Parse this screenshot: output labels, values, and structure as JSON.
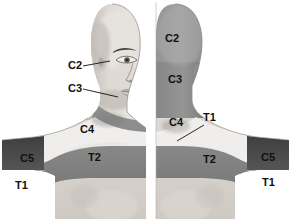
{
  "figure": {
    "type": "anatomical-dermatome-illustration",
    "panel_count": 2,
    "background_color": "#ffffff"
  },
  "palette": {
    "skin_light": "#e7e3df",
    "skin_mid": "#cfcac5",
    "skin_shadow": "#b4aea8",
    "c2_band": "#9a9a9a",
    "c3_band": "#8d8d8d",
    "c4_band": "#efeeec",
    "t2_band": "#7f7f7f",
    "c5_band": "#4a4a4a",
    "t1_band": "#9e9e9e",
    "outline": "#6b6b6b",
    "label_text": "#111111",
    "leader_line": "#111111"
  },
  "panels": [
    {
      "id": "anterior",
      "name": "anterior-view",
      "view_label": "anterior",
      "description": "Front view, right half of face and chest with dermatome bands",
      "labels": [
        {
          "text": "C2",
          "x": 68,
          "y": 69,
          "has_leader": true,
          "leader": "M 83 66 L 110 61"
        },
        {
          "text": "C3",
          "x": 68,
          "y": 92,
          "has_leader": true,
          "leader": "M 83 89 L 118 97"
        },
        {
          "text": "C4",
          "x": 80,
          "y": 133,
          "has_leader": false,
          "leader": ""
        },
        {
          "text": "T2",
          "x": 88,
          "y": 161,
          "has_leader": false,
          "leader": ""
        },
        {
          "text": "C5",
          "x": 20,
          "y": 162,
          "has_leader": false,
          "leader": ""
        },
        {
          "text": "T1",
          "x": 15,
          "y": 189,
          "has_leader": false,
          "leader": ""
        }
      ]
    },
    {
      "id": "posterior",
      "name": "posterior-view",
      "view_label": "posterior",
      "description": "Back view, left half of head and shoulders with dermatome bands",
      "labels": [
        {
          "text": "C2",
          "x": 165,
          "y": 42,
          "has_leader": false,
          "leader": ""
        },
        {
          "text": "C3",
          "x": 168,
          "y": 83,
          "has_leader": false,
          "leader": ""
        },
        {
          "text": "C4",
          "x": 169,
          "y": 126,
          "has_leader": false,
          "leader": ""
        },
        {
          "text": "T1",
          "x": 203,
          "y": 121,
          "has_leader": true,
          "leader": "M 204 125 L 177 141"
        },
        {
          "text": "T2",
          "x": 203,
          "y": 163,
          "has_leader": false,
          "leader": ""
        },
        {
          "text": "C5",
          "x": 261,
          "y": 161,
          "has_leader": false,
          "leader": ""
        },
        {
          "text": "T1",
          "x": 262,
          "y": 186,
          "has_leader": false,
          "leader": ""
        }
      ]
    }
  ],
  "dermatomes": [
    {
      "code": "C2",
      "shade": "#9a9a9a",
      "region": "upper posterior scalp / angle of jaw"
    },
    {
      "code": "C3",
      "shade": "#8d8d8d",
      "region": "lower occiput and neck"
    },
    {
      "code": "C4",
      "shade": "#efeeec",
      "region": "base of neck, supraclavicular, top of shoulder"
    },
    {
      "code": "C5",
      "shade": "#4a4a4a",
      "region": "lateral shoulder / upper lateral arm"
    },
    {
      "code": "T1",
      "shade": "#9e9e9e",
      "region": "medial arm / axilla"
    },
    {
      "code": "T2",
      "shade": "#7f7f7f",
      "region": "upper chest and upper back band"
    }
  ]
}
